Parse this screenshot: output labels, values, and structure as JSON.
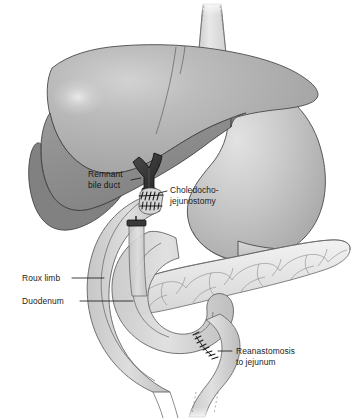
{
  "figure": {
    "canvas": {
      "width": 354,
      "height": 420,
      "background": "#ffffff"
    }
  },
  "labels": [
    {
      "id": "remnant-bile-duct",
      "lines": [
        "Remnant",
        "bile duct"
      ],
      "line1": "Remnant",
      "line2": "bile duct",
      "x": 88,
      "y": 174,
      "anchor": "start",
      "on_dark": true
    },
    {
      "id": "choledocho-jejunostomy",
      "lines": [
        "Choledocho-",
        "jejunostomy"
      ],
      "line1": "Choledocho-",
      "line2": "jejunostomy",
      "x": 170,
      "y": 190,
      "anchor": "start",
      "on_dark": false
    },
    {
      "id": "roux-limb",
      "lines": [
        "Roux limb"
      ],
      "line1": "Roux limb",
      "x": 22,
      "y": 281,
      "anchor": "start",
      "on_dark": false
    },
    {
      "id": "duodenum",
      "lines": [
        "Duodenum"
      ],
      "line1": "Duodenum",
      "x": 22,
      "y": 304,
      "anchor": "start",
      "on_dark": false
    },
    {
      "id": "reanastomosis-to-jejunum",
      "lines": [
        "Reanastomosis",
        "to jejunum"
      ],
      "line1": "Reanastomosis",
      "line2": "to jejunum",
      "x": 236,
      "y": 352,
      "anchor": "start",
      "on_dark": false
    }
  ],
  "structures": [
    {
      "id": "liver",
      "name": "Liver",
      "fill": "#b0b0b0",
      "shade": "#8f8f8f",
      "outline": "#4a4a4a"
    },
    {
      "id": "liver-inferior-surface",
      "name": "Liver visceral surface",
      "fill": "#8a8a8a"
    },
    {
      "id": "stomach",
      "name": "Stomach",
      "fill": "#c2c2c2",
      "outline": "#4a4a4a"
    },
    {
      "id": "esophagus",
      "name": "Esophagus",
      "fill": "#dcdcdc",
      "outline": "#8a8a8a"
    },
    {
      "id": "pancreas",
      "name": "Pancreas",
      "fill": "#e6e6e6",
      "outline": "#6b6b6b"
    },
    {
      "id": "duodenum-loop",
      "name": "Duodenum",
      "fill": "#c9c9c9",
      "outline": "#5e5e5e"
    },
    {
      "id": "roux-limb-tube",
      "name": "Roux limb jejunal tube",
      "fill": "#d3d3d3",
      "outline": "#5e5e5e"
    },
    {
      "id": "bile-duct",
      "name": "Remnant bile duct",
      "fill": "#3a3a3a",
      "outline": "#1a1a1a"
    },
    {
      "id": "jejunum-efferent",
      "name": "Efferent jejunal limb",
      "fill": "#d8d8d8",
      "outline": "#6b6b6b"
    }
  ],
  "colors": {
    "ink": "#1c1c1c",
    "outline": "#4a4a4a",
    "liver_light": "#b4b4b4",
    "liver_dark": "#8a8a8a",
    "stomach": "#c2c2c2",
    "pancreas": "#e8e8e8",
    "bowel": "#d2d2d2",
    "duct_dark": "#333333",
    "background": "#ffffff"
  }
}
